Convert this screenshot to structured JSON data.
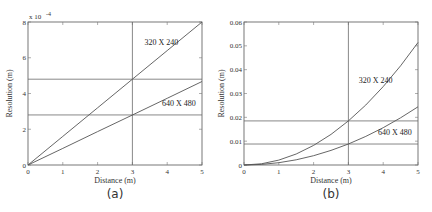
{
  "chart_data": [
    {
      "type": "line",
      "caption": "(a)",
      "xlabel": "Distance (m)",
      "ylabel": "Resolution (m)",
      "y_multiplier": "x 10",
      "y_exponent": "-4",
      "xlim": [
        0,
        5
      ],
      "ylim": [
        0,
        8
      ],
      "y_scale": 0.0001,
      "xticks": [
        0,
        1,
        2,
        3,
        4,
        5
      ],
      "yticks": [
        0,
        2,
        4,
        6,
        8
      ],
      "ytick_labels": [
        "0",
        "2",
        "4",
        "6",
        "8"
      ],
      "grid": false,
      "x": [
        0,
        1,
        2,
        3,
        4,
        5
      ],
      "series": [
        {
          "name": "320 X 240",
          "values": [
            0,
            1.6,
            3.2,
            4.8,
            6.4,
            8.0
          ],
          "label_pos": [
            3.35,
            6.7
          ]
        },
        {
          "name": "640 X 480",
          "values": [
            0,
            0.93,
            1.87,
            2.8,
            3.73,
            4.67
          ],
          "label_pos": [
            3.85,
            3.3
          ]
        }
      ],
      "reference_lines": {
        "vertical_x": 3,
        "horizontal_y": [
          4.8,
          2.8
        ]
      }
    },
    {
      "type": "line",
      "caption": "(b)",
      "xlabel": "Distance (m)",
      "ylabel": "Resolution (m)",
      "xlim": [
        0,
        5
      ],
      "ylim": [
        0,
        0.06
      ],
      "xticks": [
        0,
        1,
        2,
        3,
        4,
        5
      ],
      "yticks": [
        0,
        0.01,
        0.02,
        0.03,
        0.04,
        0.05,
        0.06
      ],
      "ytick_labels": [
        "0",
        "0.01",
        "0.02",
        "0.03",
        "0.04",
        "0.05",
        "0.06"
      ],
      "grid": false,
      "x": [
        0,
        0.5,
        1,
        1.5,
        2,
        2.5,
        3,
        3.5,
        4,
        4.5,
        5
      ],
      "series": [
        {
          "name": "320 X 240",
          "values": [
            0,
            0.00051,
            0.00206,
            0.00462,
            0.00822,
            0.01285,
            0.0185,
            0.02518,
            0.03289,
            0.04163,
            0.0514
          ],
          "label_pos": [
            3.3,
            0.0345
          ]
        },
        {
          "name": "640 X 480",
          "values": [
            0,
            0.00024,
            0.00098,
            0.0022,
            0.00391,
            0.00611,
            0.0088,
            0.01198,
            0.01564,
            0.0198,
            0.02444
          ],
          "label_pos": [
            3.85,
            0.0125
          ]
        }
      ],
      "reference_lines": {
        "vertical_x": 3,
        "horizontal_y": [
          0.0185,
          0.0088
        ]
      }
    }
  ]
}
